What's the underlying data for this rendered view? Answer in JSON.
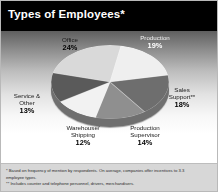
{
  "header": {
    "title": "Types of Employees*"
  },
  "chart_data": {
    "type": "pie",
    "title": "Types of Employees*",
    "categories": [
      "Office",
      "Production",
      "Sales Support**",
      "Production Supervisor",
      "Warehouse/Shipping",
      "Service & Other"
    ],
    "values": [
      24,
      19,
      18,
      14,
      12,
      13
    ],
    "value_labels": [
      "24%",
      "19%",
      "18%",
      "14%",
      "12%",
      "13%"
    ],
    "unit": "%",
    "legend_position": "none",
    "grid": false,
    "slice_colors": [
      "#d9d9d9",
      "#efefef",
      "#6e6e6e",
      "#8f8f8f",
      "#f2f2f2",
      "#5a5a5a"
    ],
    "labels": {
      "office": {
        "name": "Office",
        "pct": "24%"
      },
      "production": {
        "name": "Production",
        "pct": "19%"
      },
      "sales": {
        "name": "Sales",
        "name2": "Support**",
        "pct": "18%"
      },
      "supervisor": {
        "name": "Production",
        "name2": "Supervisor",
        "pct": "14%"
      },
      "warehouse": {
        "name": "Warehouse/",
        "name2": "Shipping",
        "pct": "12%"
      },
      "service": {
        "name": "Service &",
        "name2": "Other",
        "pct": "13%"
      }
    }
  },
  "footnotes": {
    "line1": "* Based on frequency of mention by respondents. On average, companies offer incentives to 3.3",
    "line2": "employee types.",
    "line3": "** Includes counter and telephone personnel, drivers, merchandisers."
  }
}
